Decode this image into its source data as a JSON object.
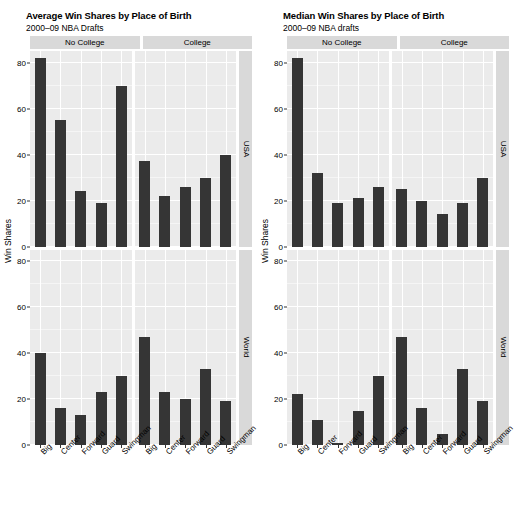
{
  "charts": [
    {
      "id": "average",
      "title": "Average Win Shares by Place of Birth",
      "subtitle": "2000–09 NBA Drafts",
      "ylabel": "Win Shares"
    },
    {
      "id": "median",
      "title": "Median Win Shares by Place of Birth",
      "subtitle": "2000–09 NBA drafts",
      "ylabel": "Win Shares"
    }
  ],
  "strips": {
    "columns": [
      "No College",
      "College"
    ],
    "rows": [
      "USA",
      "World"
    ]
  },
  "axis": {
    "yticks": [
      "0",
      "20",
      "40",
      "60",
      "80"
    ],
    "xcategories": [
      "Big",
      "Center",
      "Forward",
      "Guard",
      "Swingman"
    ]
  },
  "colors": {
    "bar": "#353535",
    "panel_background": "#ebebeb",
    "strip_background": "#d9d9d9",
    "gridline": "#ffffff",
    "text": "#000000"
  },
  "chart_data": [
    {
      "type": "bar",
      "title": "Average Win Shares by Place of Birth",
      "subtitle": "2000–09 NBA Drafts",
      "xlabel": "",
      "ylabel": "Win Shares",
      "ylim": [
        0,
        85
      ],
      "grid": true,
      "legend": "none",
      "facet_columns": [
        "No College",
        "College"
      ],
      "facet_rows": [
        "USA",
        "World"
      ],
      "categories": [
        "Big",
        "Center",
        "Forward",
        "Guard",
        "Swingman"
      ],
      "panels": [
        {
          "row": "USA",
          "column": "No College",
          "values": [
            82,
            55,
            24,
            19,
            70
          ]
        },
        {
          "row": "USA",
          "column": "College",
          "values": [
            37,
            22,
            26,
            30,
            40
          ]
        },
        {
          "row": "World",
          "column": "No College",
          "values": [
            40,
            16,
            13,
            23,
            30
          ]
        },
        {
          "row": "World",
          "column": "College",
          "values": [
            47,
            23,
            20,
            33,
            19
          ]
        }
      ]
    },
    {
      "type": "bar",
      "title": "Median Win Shares by Place of Birth",
      "subtitle": "2000–09 NBA drafts",
      "xlabel": "",
      "ylabel": "Win Shares",
      "ylim": [
        0,
        85
      ],
      "grid": true,
      "legend": "none",
      "facet_columns": [
        "No College",
        "College"
      ],
      "facet_rows": [
        "USA",
        "World"
      ],
      "categories": [
        "Big",
        "Center",
        "Forward",
        "Guard",
        "Swingman"
      ],
      "panels": [
        {
          "row": "USA",
          "column": "No College",
          "values": [
            82,
            32,
            19,
            21,
            26
          ]
        },
        {
          "row": "USA",
          "column": "College",
          "values": [
            25,
            20,
            14,
            19,
            30
          ]
        },
        {
          "row": "World",
          "column": "No College",
          "values": [
            22,
            11,
            1,
            15,
            30
          ]
        },
        {
          "row": "World",
          "column": "College",
          "values": [
            47,
            16,
            5,
            33,
            19
          ]
        }
      ]
    }
  ]
}
